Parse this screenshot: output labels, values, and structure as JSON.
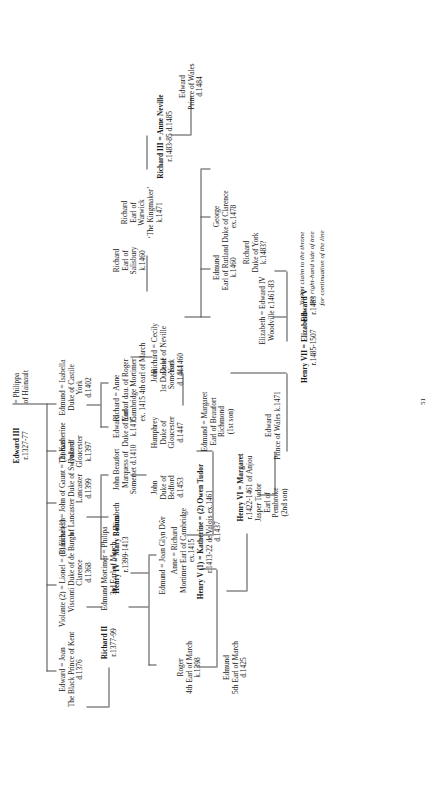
{
  "document": {
    "type": "genealogical-family-tree",
    "title": "Plantagenet, Lancaster, York and Tudor royal descent from Edward III",
    "orientation": "rotated-90-counterclockwise",
    "page_number": "51"
  },
  "note": {
    "line1": "Yorkist claim to the throne",
    "line2": "See right-hand side of tree",
    "line3": "for continuation of the line"
  },
  "nodes": {
    "edward3": {
      "l1": "Edward III",
      "l2": "r.1327-77",
      "bold1": true
    },
    "philippa": {
      "l1": "= Philippa",
      "l2": "of Hainault"
    },
    "black_prince": {
      "l1": "Edward = Joan",
      "l2": "The Black Prince   of Kent",
      "l3": "d.1376"
    },
    "lionel": {
      "l1": "Violante (2) = Lionel  = (1) Elizabeth",
      "l2": "Visconti        Duke of        de Burgh",
      "l3": "Clarence",
      "l4": "d.1368"
    },
    "gaunt": {
      "l1": "Blanche (1) = John of Gaunt = (2) Katherine",
      "l2": "of Lancaster       Duke of            Swynford",
      "l3": "Lancaster",
      "l4": "d.1399"
    },
    "thomas_gloucester": {
      "l1": "Thomas",
      "l2": "Duke of",
      "l3": "Gloucester",
      "l4": "k.1397"
    },
    "edmund_york": {
      "l1": "Edmund = Isabella",
      "l2": "Duke of      Castile",
      "l3": "York",
      "l4": "d.1402"
    },
    "richard2": {
      "l1": "Richard II",
      "l2": "r.1377-99",
      "bold1": true
    },
    "edmund_mortimer3": {
      "l1": "Edmund Mortimer = Philipa",
      "l2": "3rd Earl of March"
    },
    "henry4": {
      "l1": "Henry IV = Mary Bohun",
      "l2": "r.1399-1413",
      "bold1": true
    },
    "elizabeth_gaunt": {
      "l1": "Elizabeth"
    },
    "john_beaufort": {
      "l1": "John Beaufort",
      "l2": "Marquess of",
      "l3": "Somerset d.1410"
    },
    "edward_york2": {
      "l1": "Edward",
      "l2": "Duke of York",
      "l3": "k.1415"
    },
    "richard_cambridge": {
      "l1": "Richard = Anne",
      "l2": "Earl of       dau. of Roger",
      "l3": "Cambridge    Mortimer",
      "l4": "ex. 1415      4th earl of March"
    },
    "edmund_glyndwr": {
      "l1": "Edmund = Joan Glyn Dŵr"
    },
    "roger_mortimer4": {
      "l1": "Roger",
      "l2": "4th Earl of March",
      "l3": "k.1398"
    },
    "henry5": {
      "l1": "Henry V (1) = Katherine = (2) Owen Tudor",
      "l2": "r.1413-22          de Valois        ex.1461",
      "l3": "d.1437",
      "bold1": true
    },
    "john_bedford": {
      "l1": "John",
      "l2": "Duke of",
      "l3": "Bedford",
      "l4": "d.1453"
    },
    "humphrey_gloucester": {
      "l1": "Humphrey",
      "l2": "Duke of",
      "l3": "Gloucester",
      "l4": "d.1447"
    },
    "john_somerset": {
      "l1": "John",
      "l2": "1st Duke of",
      "l3": "Somerset",
      "l4": "d.1444"
    },
    "richard_york": {
      "l1": "Richard = Cecily",
      "l2": "Duke of      Neville",
      "l3": "York",
      "l4": "k.1460"
    },
    "richard_salisbury": {
      "l1": "Richard",
      "l2": "Earl of",
      "l3": "Salisbury",
      "l4": "k.1460"
    },
    "edmund_mortimer5": {
      "l1": "Edmund",
      "l2": "5th Earl of March",
      "l3": "d.1425"
    },
    "anne_mortimer": {
      "l1": "Anne  = Richard",
      "l2": "Mortimer   Earl of Cambridge",
      "l3": "ex.1415"
    },
    "henry6": {
      "l1": "Henry VI = Margaret",
      "l2": "r.1422-1461   of Anjou",
      "bold1": true
    },
    "jasper_tudor": {
      "l1": "Jasper Tudor",
      "l2": "Earl of",
      "l3": "Pembroke",
      "l4": "(2nd son)"
    },
    "edmund_tudor": {
      "l1": "Edmund = Margaret",
      "l2": "Earl of          Beaufort",
      "l3": "Richmond",
      "l4": "(1st son)"
    },
    "richard_warwick": {
      "l1": "Richard",
      "l2": "Earl of",
      "l3": "Warwick",
      "l4": "‘The Kingmaker’",
      "l5": "k.1471"
    },
    "edward_prince_wales_1471": {
      "l1": "Edward",
      "l2": "Prince of Wales k.1471"
    },
    "george_clarence": {
      "l1": "George",
      "l2": "Duke of Clarence",
      "l3": "ex.1478"
    },
    "richard3": {
      "l1": "Richard III = Anne Neville",
      "l2": "r.1483-85        d.1485",
      "bold1": true
    },
    "edward4": {
      "l1": "Elizabeth = Edward IV",
      "l2": "Woodville    r.1461-83"
    },
    "edmund_rutland": {
      "l1": "Edmund",
      "l2": "Earl of Rutland",
      "l3": "k.1460"
    },
    "henry7": {
      "l1": "Henry VII = Elizabeth",
      "l2": "r.1485-1507",
      "bold1": true
    },
    "edward5": {
      "l1": "Edward  V",
      "l2": "r.1483",
      "bold1": true
    },
    "richard_york_1483": {
      "l1": "Richard",
      "l2": "Duke of York",
      "l3": "k.1483?"
    },
    "edward_prince_wales_1484": {
      "l1": "Edward",
      "l2": "Prince of Wales",
      "l3": "d.1484"
    }
  }
}
